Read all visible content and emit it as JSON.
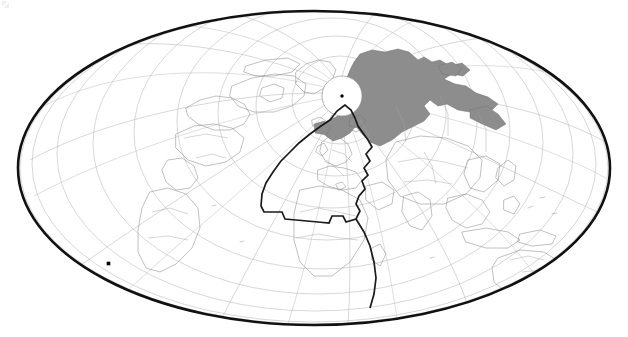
{
  "figure": {
    "kind": "world-map",
    "projection": "Mollweide (Hammer-style oval), north-polar aspect",
    "aspect_center_lat": 90,
    "background_color": "#ffffff"
  },
  "styles": {
    "outer_border_color": "#111111",
    "outer_border_width": 2.6,
    "graticule_color": "#b9b6b6",
    "graticule_width": 0.55,
    "coastline_color": "#8f8c8c",
    "coastline_width": 0.55,
    "border_line_color": "#a6a3a3",
    "highlight_fill": "#8d8d8d",
    "highlight_stroke": "#6f6f6f",
    "sector_outline_color": "#1a1a1a",
    "sector_outline_width": 1.7,
    "pole_cap_fill": "#ffffff",
    "pole_cap_stroke": "#8f8c8c",
    "pole_dot_color": "#000000",
    "point_marker_color": "#000000"
  },
  "geometry": {
    "ellipse": {
      "cx": 314,
      "cy": 168,
      "rx": 296,
      "ry": 157
    },
    "pole_cap": {
      "cx": 342,
      "cy": 96,
      "r": 20
    },
    "pole_dot": {
      "cx": 342,
      "cy": 96,
      "r": 1.7
    },
    "point_marker": {
      "cx": 108.5,
      "cy": 263.5,
      "size": 3.6
    }
  },
  "graticule": {
    "meridian_interval_deg": 30,
    "parallel_interval_deg": 15,
    "meridian_count": 12,
    "parallel_count": 11
  },
  "layers": [
    {
      "name": "graticule",
      "label": "Latitude / longitude grid",
      "visible": true
    },
    {
      "name": "coastlines",
      "label": "Coastlines",
      "visible": true
    },
    {
      "name": "country-borders",
      "label": "Country borders",
      "visible": true
    },
    {
      "name": "highlight-region",
      "label": "Shaded region (northern Asia)",
      "visible": true
    },
    {
      "name": "sector-outline",
      "label": "Outlined sector (Europe / North Atlantic)",
      "visible": true
    },
    {
      "name": "pole-cap",
      "label": "North polar cap",
      "visible": true
    },
    {
      "name": "point-marker",
      "label": "Point marker (southern Pacific)",
      "visible": true
    }
  ],
  "shapes": {
    "highlight_region": "M 360 54 L 372 50 L 385 52 L 398 49 L 409 52 L 418 60 L 424 57 L 432 62 L 440 60 L 450 66 L 462 63 L 470 70 L 463 76 L 452 74 L 444 79 L 455 84 L 466 86 L 476 93 L 488 97 L 498 104 L 492 110 L 480 108 L 470 112 L 458 110 L 447 104 L 438 106 L 430 100 L 424 106 L 430 114 L 424 121 L 414 126 L 402 132 L 392 140 L 380 146 L 370 142 L 362 134 L 356 126 L 350 133 L 342 138 L 333 141 L 326 136 L 322 128 L 327 121 L 336 117 L 344 112 L 340 104 L 336 96 L 340 88 L 346 80 L 350 70 L 354 62 Z",
    "highlight_patch_a": "M 322 126 L 330 124 L 336 129 L 331 136 L 323 135 Z",
    "highlight_patch_b": "M 350 118 L 360 115 L 366 121 L 358 128 L 349 126 Z",
    "sector_outline": "M 345 105 L 337 111 L 330 120 L 321 126 L 310 134 L 299 143 L 290 152 L 281 161 L 273 172 L 266 183 L 262 194 L 261 206 L 264 212 L 273 212 L 282 212 L 285 219 L 296 220 L 307 221 L 318 222 L 329 223 L 332 216 L 343 216 L 346 222 L 356 219 L 360 211 L 356 204 L 359 196 L 365 189 L 362 181 L 368 175 L 364 168 L 370 161 L 366 154 L 372 147 L 368 140 L 363 133 L 358 126 L 355 118 L 351 110 Z"
  }
}
